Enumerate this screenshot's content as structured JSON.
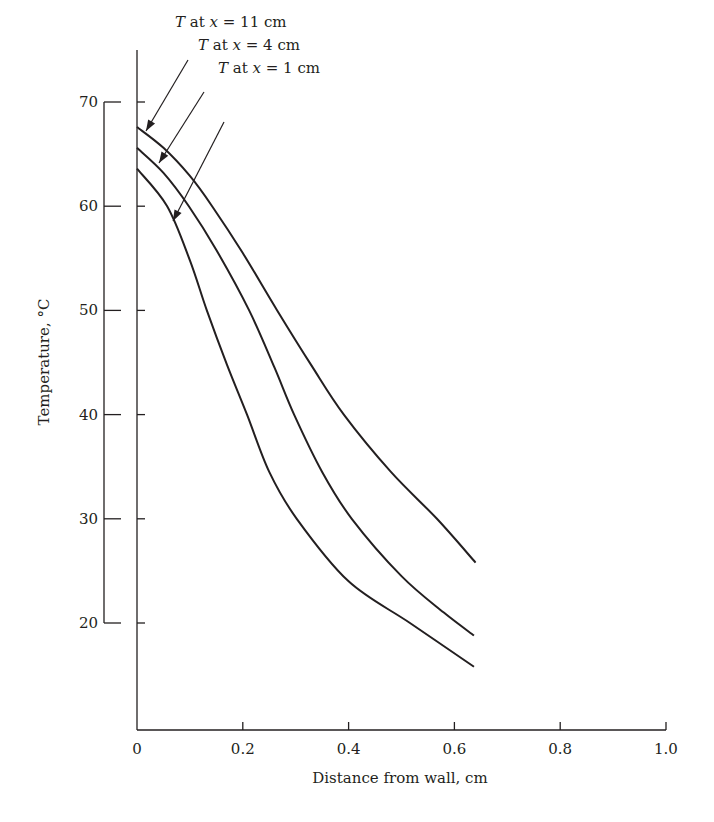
{
  "chart_data": {
    "type": "line",
    "title": "",
    "xlabel": "Distance from wall, cm",
    "ylabel": "Temperature, °C",
    "xlim": [
      0,
      1.0
    ],
    "ylim": [
      10,
      75
    ],
    "x_ticks": [
      0,
      0.2,
      0.4,
      0.6,
      0.8,
      1.0
    ],
    "x_tick_labels": [
      "0",
      "0.2",
      "0.4",
      "0.6",
      "0.8",
      "1.0"
    ],
    "y_ticks": [
      70,
      60,
      50,
      40,
      30,
      20
    ],
    "y_tick_labels": [
      "70",
      "60",
      "50",
      "40",
      "30",
      "20"
    ],
    "grid": false,
    "legend": "none (curves labeled by arrow annotations at upper left)",
    "series": [
      {
        "name": "T at x = 11 cm",
        "x": [
          0,
          0.05,
          0.1,
          0.142,
          0.2,
          0.265,
          0.33,
          0.391,
          0.48,
          0.567,
          0.64
        ],
        "y": [
          67.6,
          65.6,
          62.9,
          60.0,
          55.5,
          50.0,
          44.7,
          40.0,
          34.5,
          30.0,
          25.8
        ]
      },
      {
        "name": "T at x = 4 cm",
        "x": [
          0,
          0.05,
          0.098,
          0.15,
          0.212,
          0.26,
          0.297,
          0.35,
          0.406,
          0.5,
          0.58,
          0.637
        ],
        "y": [
          65.6,
          63.2,
          60.0,
          55.8,
          50.0,
          44.5,
          40.0,
          34.5,
          30.0,
          24.5,
          21.0,
          18.8
        ]
      },
      {
        "name": "T at x = 1 cm",
        "x": [
          0,
          0.057,
          0.1,
          0.132,
          0.17,
          0.208,
          0.25,
          0.302,
          0.4,
          0.516,
          0.637
        ],
        "y": [
          63.6,
          60.0,
          54.8,
          50.0,
          44.8,
          40.0,
          34.5,
          30.0,
          24.0,
          20.0,
          15.8
        ]
      }
    ],
    "annotations": [
      {
        "italic": "T",
        "text": " at ",
        "var": "x",
        "rest": " = 11 cm"
      },
      {
        "italic": "T",
        "text": " at ",
        "var": "x",
        "rest": " = 4 cm"
      },
      {
        "italic": "T",
        "text": " at ",
        "var": "x",
        "rest": " = 1 cm"
      }
    ],
    "colors": {
      "ink": "#231f20",
      "background": "#ffffff"
    }
  }
}
